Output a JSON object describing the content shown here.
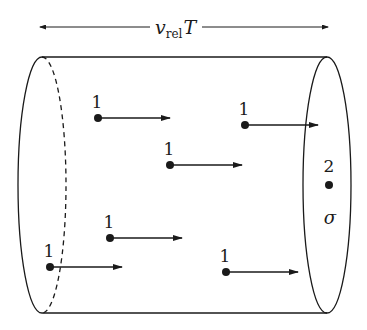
{
  "title_label": {
    "main": "v",
    "subscript": "rel",
    "suffix": "T"
  },
  "cylinder": {
    "left_x": 42,
    "right_x": 327,
    "top_y": 57,
    "bottom_y": 313,
    "rx": 24
  },
  "beam_particles": [
    {
      "label": "1",
      "x": 98,
      "y": 118,
      "arrow_end": 170
    },
    {
      "label": "1",
      "x": 245,
      "y": 125,
      "arrow_end": 318
    },
    {
      "label": "1",
      "x": 170,
      "y": 165,
      "arrow_end": 242
    },
    {
      "label": "1",
      "x": 110,
      "y": 238,
      "arrow_end": 182
    },
    {
      "label": "1",
      "x": 50,
      "y": 267,
      "arrow_end": 122
    },
    {
      "label": "1",
      "x": 226,
      "y": 272,
      "arrow_end": 298
    }
  ],
  "target": {
    "label": "2",
    "x": 329,
    "y": 185,
    "cross_section_label": "σ"
  },
  "colors": {
    "stroke": "#1a1a1a",
    "background": "#ffffff"
  }
}
